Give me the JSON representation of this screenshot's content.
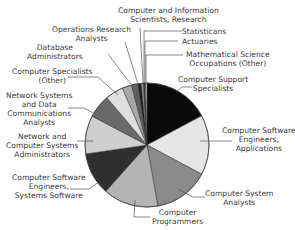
{
  "chart_data": {
    "type": "pie",
    "title": "",
    "center": [
      147,
      145
    ],
    "radius": 62,
    "start_angle_deg": 0,
    "direction": "clockwise",
    "slices": [
      {
        "label": "Computer Support Specialists",
        "value": 17.2,
        "color": "#0a0a0a"
      },
      {
        "label": "Computer Software Engineers, Applications",
        "value": 15.6,
        "color": "#e6e6e6"
      },
      {
        "label": "Computer System Analysts",
        "value": 14.4,
        "color": "#8a8a8a"
      },
      {
        "label": "Computer Programmers",
        "value": 14.4,
        "color": "#b4b4b4"
      },
      {
        "label": "Computer Software Engineers, Systems Software",
        "value": 11.1,
        "color": "#2e2e2e"
      },
      {
        "label": "Network and Computer Systems Administrators",
        "value": 10.0,
        "color": "#cfcfcf"
      },
      {
        "label": "Network Systems and Data Communications Analysts",
        "value": 6.1,
        "color": "#6a6a6a"
      },
      {
        "label": "Computer Specialists (Other)",
        "value": 4.7,
        "color": "#dedede"
      },
      {
        "label": "Database Administrators",
        "value": 2.5,
        "color": "#a8a8a8"
      },
      {
        "label": "Operations Research Analysts",
        "value": 1.7,
        "color": "#606060"
      },
      {
        "label": "Computer and Information Scientists, Research",
        "value": 0.8,
        "color": "#1e1e1e"
      },
      {
        "label": "Statisticians",
        "value": 0.6,
        "color": "#9a9a9a"
      },
      {
        "label": "Actuaries",
        "value": 0.5,
        "color": "#3c3c3c"
      },
      {
        "label": "Mathematical Science Occupations (Other)",
        "value": 0.4,
        "color": "#c8c8c8"
      }
    ],
    "legend": "none (callout labels with leader lines)"
  },
  "labels": {
    "cis_research": [
      "Computer and Information",
      "Scientists, Research"
    ],
    "ops_research": [
      "Operations Research",
      "Analysts"
    ],
    "db_admin": [
      "Database",
      "Administrators"
    ],
    "comp_spec_other": [
      "Computer Specialists",
      "(Other)"
    ],
    "net_sys_data": [
      "Network Systems",
      "and Data",
      "Communications",
      "Analysts"
    ],
    "net_comp_admin": [
      "Network and",
      "Computer Systems",
      "Administrators"
    ],
    "cse_systems": [
      "Computer Software",
      "Engineers,",
      "Systems Software"
    ],
    "programmers": [
      "Computer",
      "Programmers"
    ],
    "system_analysts": [
      "Computer System",
      "Analysts"
    ],
    "cse_apps": [
      "Computer Software",
      "Engineers,",
      "Applications"
    ],
    "support": [
      "Computer Support",
      "Specialists"
    ],
    "math_other": [
      "Mathematical Science",
      "Occupations (Other)"
    ],
    "actuaries": [
      "Actuaries"
    ],
    "statisticians": [
      "Statisticans"
    ]
  }
}
